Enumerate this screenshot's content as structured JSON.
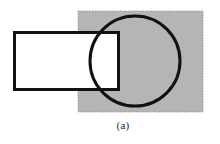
{
  "figure": {
    "caption": "(a)",
    "background_color": "#ffffff",
    "stroke_color": "#111111",
    "shapes": {
      "square": {
        "label": "shaded square region",
        "fill_color": "#b5b5b5",
        "edge_color": "#9a9a9a",
        "edge_style": "dotted",
        "x": 78,
        "y": 11,
        "width": 125,
        "height": 101
      },
      "rectangle": {
        "label": "outlined rectangle",
        "fill_color": "#ffffff",
        "stroke_color": "#111111",
        "stroke_width": 3,
        "x": 13,
        "y": 31,
        "width": 107,
        "height": 60
      },
      "circle": {
        "label": "outlined circle",
        "fill_color": "none",
        "stroke_color": "#111111",
        "stroke_width": 3,
        "cx": 135,
        "cy": 61,
        "r": 45
      }
    }
  }
}
